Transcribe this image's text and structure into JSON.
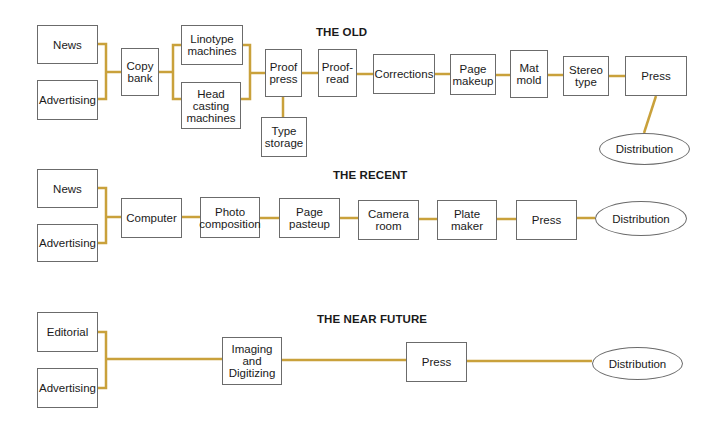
{
  "colors": {
    "connector": "#c9a13b",
    "box_border": "#6b6b6b",
    "background": "#ffffff",
    "text": "#1a1a1a"
  },
  "sections": {
    "old": {
      "title": "THE OLD",
      "nodes": {
        "news": "News",
        "advertising": "Advertising",
        "copy_bank": "Copy\nbank",
        "linotype": "Linotype\nmachines",
        "head_casting": "Head\ncasting\nmachines",
        "proof_press": "Proof\npress",
        "type_storage": "Type\nstorage",
        "proof_read": "Proof-\nread",
        "corrections": "Corrections",
        "page_makeup": "Page\nmakeup",
        "mat_mold": "Mat\nmold",
        "stereo_type": "Stereo\ntype",
        "press": "Press",
        "distribution": "Distribution"
      }
    },
    "recent": {
      "title": "THE RECENT",
      "nodes": {
        "news": "News",
        "advertising": "Advertising",
        "computer": "Computer",
        "photo_composition": "Photo\ncomposition",
        "page_pasteup": "Page\npasteup",
        "camera_room": "Camera\nroom",
        "plate_maker": "Plate\nmaker",
        "press": "Press",
        "distribution": "Distribution"
      }
    },
    "near_future": {
      "title": "THE NEAR FUTURE",
      "nodes": {
        "editorial": "Editorial",
        "advertising": "Advertising",
        "imaging": "Imaging\nand\nDigitizing",
        "press": "Press",
        "distribution": "Distribution"
      }
    }
  }
}
